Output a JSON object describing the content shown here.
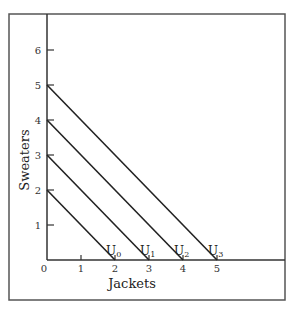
{
  "chart_data": {
    "type": "line",
    "title": "",
    "xlabel": "Jackets",
    "ylabel": "Sweaters",
    "xlim": [
      0,
      7
    ],
    "ylim": [
      0,
      7
    ],
    "x_ticks": [
      "0",
      "1",
      "2",
      "3",
      "4",
      "5"
    ],
    "y_ticks": [
      "1",
      "2",
      "3",
      "4",
      "5",
      "6"
    ],
    "grid": false,
    "legend": "none (curves labeled directly at x-intercepts)",
    "series": [
      {
        "name": "U0",
        "label_main": "U",
        "label_sub": "0",
        "points": [
          [
            0,
            2
          ],
          [
            2,
            0
          ]
        ]
      },
      {
        "name": "U1",
        "label_main": "U",
        "label_sub": "1",
        "points": [
          [
            0,
            3
          ],
          [
            3,
            0
          ]
        ]
      },
      {
        "name": "U2",
        "label_main": "U",
        "label_sub": "2",
        "points": [
          [
            0,
            4
          ],
          [
            4,
            0
          ]
        ]
      },
      {
        "name": "U3",
        "label_main": "U",
        "label_sub": "3",
        "points": [
          [
            0,
            5
          ],
          [
            5,
            0
          ]
        ]
      }
    ],
    "line_color": "#222222",
    "frame_color": "#444444"
  }
}
